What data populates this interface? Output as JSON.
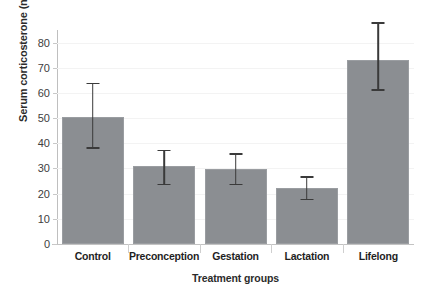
{
  "chart_data": {
    "type": "bar",
    "title": "",
    "xlabel": "Treatment groups",
    "ylabel": "Serum corticosterone (ng/ml)",
    "categories": [
      "Control",
      "Preconception",
      "Gestation",
      "Lactation",
      "Lifelong"
    ],
    "values": [
      50.5,
      30.8,
      29.8,
      22.2,
      73.0
    ],
    "error_upper": [
      64.0,
      37.5,
      36.0,
      27.0,
      88.0
    ],
    "error_lower": [
      38.5,
      24.0,
      24.0,
      18.0,
      61.5
    ],
    "ylim": [
      0,
      85
    ],
    "yticks": [
      0,
      10,
      20,
      30,
      40,
      50,
      60,
      70,
      80
    ],
    "ytick_labels": [
      "0",
      "10",
      "20",
      "30",
      "40",
      "50",
      "60",
      "70",
      "80"
    ],
    "grid": true,
    "legend": "none",
    "bar_color": "#8b8e92",
    "error_color": "#3a3a3a",
    "axis_color": "#bfbfbf"
  }
}
